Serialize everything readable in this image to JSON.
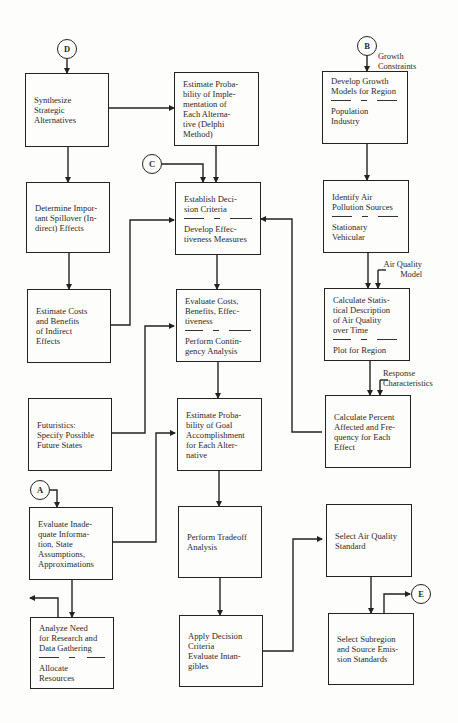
{
  "connectors": {
    "A": "A",
    "B": "B",
    "C": "C",
    "D": "D",
    "E": "E"
  },
  "edge_labels": {
    "growth_constraints": "Growth\nConstraints",
    "air_quality_model": "Air Quality\nModel",
    "response_characteristics": "Response\nCharacteristics"
  },
  "column1": {
    "synthesize": "Synthesize\nStrategic\nAlternatives",
    "spillover": "Determine Impor-\ntant Spillover (In-\ndirect) Effects",
    "indirect_costs": "Estimate Costs\nand Benefits\nof Indirect\nEffects",
    "futuristics": "Futuristics:\nSpecify Possible\nFuture States",
    "inadequate_info": "Evaluate Inade-\nquate Informa-\ntion, State\nAssumptions,\nApproximations",
    "research_need": {
      "top": "Analyze Need\nfor Research and\nData Gathering",
      "bottom": "Allocate Resources"
    }
  },
  "column2": {
    "prob_implementation": "Estimate Proba-\nbility of Imple-\nmentation of\nEach Alterna-\ntive (Delphi\nMethod)",
    "decision_criteria": {
      "top": "Establish Deci-\nsion Criteria",
      "bottom": "Develop Effec-\ntiveness Measures"
    },
    "evaluate_costs": {
      "top": "Evaluate Costs,\nBenefits, Effec-\ntiveness",
      "bottom": "Perform Contin-\ngency Analysis"
    },
    "prob_goal": "Estimate Proba-\nbility of Goal\nAccomplishment\nfor Each Alter-\nnative",
    "tradeoff": "Perform Tradeoff\nAnalysis",
    "apply_criteria": "Apply Decision\nCriteria\nEvaluate Intan-\ngibles"
  },
  "column3": {
    "growth_models": {
      "top": "Develop Growth\nModels for Region",
      "bottom": "Population Industry"
    },
    "pollution_sources": {
      "top": "Identify Air\nPollution Sources",
      "bottom": "Stationary\nVehicular"
    },
    "statistical_description": {
      "top": "Calculate Statis-\ntical Description\nof Air Quality\nover Time",
      "bottom": "Plot for Region"
    },
    "percent_affected": "Calculate Percent\nAffected and Fre-\nquency for Each\nEffect",
    "air_quality_standard": "Select Air Quality\nStandard",
    "subregion_standards": "Select Subregion\nand Source Emis-\nsion Standards"
  }
}
